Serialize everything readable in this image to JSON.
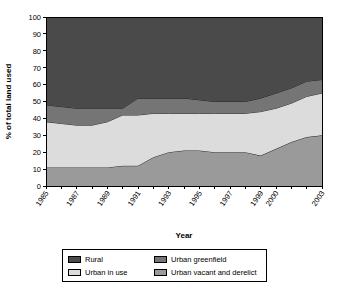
{
  "chart_data": {
    "type": "area",
    "stacked": true,
    "title": "",
    "xlabel": "Year",
    "ylabel": "% of total land used",
    "ylim": [
      0,
      100
    ],
    "ytick_step": 10,
    "yticks": [
      0,
      10,
      20,
      30,
      40,
      50,
      60,
      70,
      80,
      90,
      100
    ],
    "grid": false,
    "legend_position": "bottom",
    "x": [
      1985,
      1986,
      1987,
      1988,
      1989,
      1990,
      1991,
      1992,
      1993,
      1994,
      1995,
      1996,
      1997,
      1998,
      1999,
      2000,
      2001,
      2002,
      2003
    ],
    "xtick_labels": [
      "1985",
      "1987",
      "1989",
      "1991",
      "1993",
      "1995",
      "1997",
      "1999",
      "2000",
      "2003"
    ],
    "xtick_values": [
      1985,
      1987,
      1989,
      1991,
      1993,
      1995,
      1997,
      1999,
      2000,
      2003
    ],
    "series": [
      {
        "name": "Urban vacant and derelict",
        "color": "#9a9a9a",
        "stack_order": 1,
        "values": [
          11,
          11,
          11,
          11,
          11,
          12,
          12,
          17,
          20,
          21,
          21,
          20,
          20,
          20,
          18,
          22,
          26,
          29,
          30
        ]
      },
      {
        "name": "Urban in use",
        "color": "#dcdcdc",
        "stack_order": 2,
        "values": [
          27,
          26,
          25,
          25,
          27,
          30,
          30,
          26,
          23,
          22,
          22,
          23,
          23,
          23,
          26,
          24,
          23,
          24,
          25
        ]
      },
      {
        "name": "Urban greenfield",
        "color": "#757575",
        "stack_order": 3,
        "values": [
          10,
          10,
          10,
          10,
          8,
          4,
          10,
          9,
          9,
          9,
          8,
          7,
          7,
          7,
          8,
          9,
          9,
          9,
          8
        ]
      },
      {
        "name": "Rural",
        "color": "#4a4a4a",
        "stack_order": 4,
        "values": [
          52,
          53,
          54,
          54,
          54,
          54,
          48,
          48,
          48,
          48,
          49,
          50,
          50,
          50,
          48,
          45,
          42,
          38,
          37
        ]
      }
    ],
    "cumulative_boundaries": {
      "description": "Upper edge of each stacked band, bottom to top",
      "urban_vacant_and_derelict": [
        11,
        11,
        11,
        11,
        11,
        12,
        12,
        17,
        20,
        21,
        21,
        20,
        20,
        20,
        18,
        22,
        26,
        29,
        30
      ],
      "urban_in_use": [
        38,
        37,
        36,
        36,
        38,
        42,
        42,
        43,
        43,
        43,
        43,
        43,
        43,
        43,
        44,
        46,
        49,
        53,
        55
      ],
      "urban_greenfield": [
        48,
        47,
        46,
        46,
        46,
        46,
        52,
        52,
        52,
        52,
        51,
        50,
        50,
        50,
        52,
        55,
        58,
        62,
        63
      ],
      "rural": [
        100,
        100,
        100,
        100,
        100,
        100,
        100,
        100,
        100,
        100,
        100,
        100,
        100,
        100,
        100,
        100,
        100,
        100,
        100
      ]
    }
  },
  "legend": {
    "items": [
      {
        "label": "Rural",
        "color": "#4a4a4a"
      },
      {
        "label": "Urban greenfield",
        "color": "#757575"
      },
      {
        "label": "Urban in use",
        "color": "#dcdcdc"
      },
      {
        "label": "Urban vacant and derelict",
        "color": "#9a9a9a"
      }
    ]
  }
}
